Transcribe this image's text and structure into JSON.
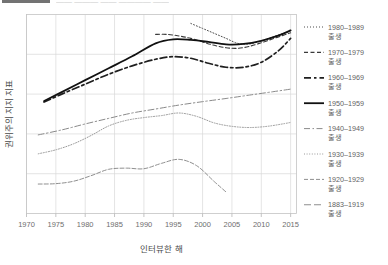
{
  "header": {
    "clipped_bar_present": true,
    "clipped_text": "—— ——— —— ———— ——"
  },
  "chart_data": {
    "type": "line",
    "title": "",
    "xlabel": "인터뷰한 해",
    "ylabel": "권위주의 지지 지표",
    "xlim": [
      1970,
      2016
    ],
    "ylim": [
      0,
      1
    ],
    "xticks": [
      1970,
      1975,
      1980,
      1985,
      1990,
      1995,
      2000,
      2005,
      2010,
      2015
    ],
    "xticklabels": [
      "1970",
      "1975",
      "1980",
      "1985",
      "1990",
      "1995",
      "2000",
      "2005",
      "2010",
      "2015"
    ],
    "yticks": [
      0.0,
      0.2,
      0.4,
      0.6,
      0.8,
      1.0
    ],
    "yticklabels": [
      "",
      "",
      "",
      "",
      "",
      ""
    ],
    "grid": true,
    "legend_position": "right",
    "series": [
      {
        "name": "1980–1989\n출생",
        "legend_label_line1": "1980–1989",
        "legend_label_line2": "출생",
        "dash": "1,2",
        "width": 1.0,
        "color": "#4d4d4d",
        "x": [
          1998,
          2000,
          2002,
          2004,
          2006,
          2008,
          2010,
          2012,
          2014,
          2015
        ],
        "y": [
          0.955,
          0.93,
          0.905,
          0.88,
          0.855,
          0.852,
          0.868,
          0.888,
          0.908,
          0.918
        ]
      },
      {
        "name": "1970–1979\n출생",
        "legend_label_line1": "1970–1979",
        "legend_label_line2": "출생",
        "dash": "4,2.5",
        "width": 1.1,
        "color": "#3a3a3a",
        "x": [
          1992,
          1994,
          1996,
          1998,
          2000,
          2002,
          2004,
          2006,
          2008,
          2010,
          2012,
          2014,
          2015
        ],
        "y": [
          0.9,
          0.9,
          0.892,
          0.88,
          0.862,
          0.845,
          0.833,
          0.83,
          0.84,
          0.858,
          0.878,
          0.898,
          0.908
        ]
      },
      {
        "name": "1960–1969\n출생",
        "legend_label_line1": "1960–1969",
        "legend_label_line2": "출생",
        "dash": "7,3,2.5,3",
        "width": 1.7,
        "color": "#1f1f1f",
        "x": [
          1973,
          1976,
          1980,
          1984,
          1988,
          1992,
          1995,
          1998,
          2001,
          2004,
          2007,
          2010,
          2013,
          2015
        ],
        "y": [
          0.56,
          0.6,
          0.65,
          0.7,
          0.742,
          0.775,
          0.788,
          0.78,
          0.755,
          0.735,
          0.735,
          0.76,
          0.82,
          0.88
        ]
      },
      {
        "name": "1950–1959\n출생",
        "legend_label_line1": "1950–1959",
        "legend_label_line2": "출생",
        "dash": "none",
        "width": 1.8,
        "color": "#111111",
        "x": [
          1973,
          1976,
          1980,
          1984,
          1988,
          1992,
          1995,
          1998,
          2001,
          2004,
          2007,
          2010,
          2013,
          2015
        ],
        "y": [
          0.565,
          0.61,
          0.67,
          0.73,
          0.79,
          0.855,
          0.875,
          0.872,
          0.862,
          0.85,
          0.852,
          0.868,
          0.895,
          0.92
        ]
      },
      {
        "name": "1940–1949\n출생",
        "legend_label_line1": "1940–1949",
        "legend_label_line2": "출생",
        "dash": "6,2.5,1.5,2.5",
        "width": 1.0,
        "color": "#8a8a8a",
        "x": [
          1972,
          1976,
          1980,
          1984,
          1988,
          1992,
          1996,
          2000,
          2004,
          2008,
          2012,
          2015
        ],
        "y": [
          0.395,
          0.42,
          0.45,
          0.478,
          0.505,
          0.525,
          0.545,
          0.562,
          0.578,
          0.595,
          0.612,
          0.625
        ]
      },
      {
        "name": "1930–1939\n출생",
        "legend_label_line1": "1930–1939",
        "legend_label_line2": "출생",
        "dash": "1,1.6",
        "width": 1.0,
        "color": "#9a9a9a",
        "x": [
          1972,
          1975,
          1978,
          1981,
          1984,
          1987,
          1990,
          1993,
          1996,
          1999,
          2002,
          2005,
          2008,
          2011,
          2014,
          2015
        ],
        "y": [
          0.3,
          0.32,
          0.35,
          0.392,
          0.44,
          0.468,
          0.482,
          0.492,
          0.505,
          0.488,
          0.455,
          0.438,
          0.432,
          0.438,
          0.452,
          0.458
        ]
      },
      {
        "name": "1920–1929\n출생",
        "legend_label_line1": "1920–1929",
        "legend_label_line2": "출생",
        "dash": "4,2",
        "width": 1.0,
        "color": "#8f8f8f",
        "x": [
          1972,
          1975,
          1978,
          1981,
          1984,
          1987,
          1990,
          1993,
          1996,
          1999,
          2002,
          2004
        ],
        "y": [
          0.148,
          0.15,
          0.162,
          0.19,
          0.222,
          0.228,
          0.225,
          0.252,
          0.272,
          0.24,
          0.16,
          0.108
        ]
      },
      {
        "name": "1883–1919\n출생",
        "legend_label_line1": "1883–1919",
        "legend_label_line2": "출생",
        "dash": "7,3",
        "width": 1.1,
        "color": "#8f8f8f",
        "x": [],
        "y": []
      }
    ]
  }
}
